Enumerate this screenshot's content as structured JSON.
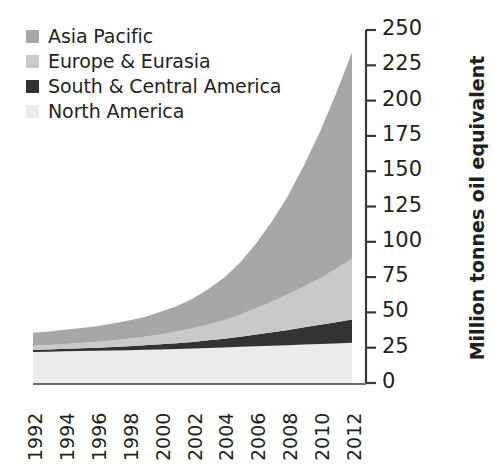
{
  "chart_data": {
    "type": "area",
    "stacked": true,
    "title": "",
    "subtitle": "",
    "xlabel": "",
    "ylabel": "Million tonnes oil equivalent",
    "x": [
      1992,
      1993,
      1994,
      1995,
      1996,
      1997,
      1998,
      1999,
      2000,
      2001,
      2002,
      2003,
      2004,
      2005,
      2006,
      2007,
      2008,
      2009,
      2010,
      2011,
      2012
    ],
    "xlim": [
      1992,
      2012
    ],
    "xticks": [
      1992,
      1994,
      1996,
      1998,
      2000,
      2002,
      2004,
      2006,
      2008,
      2010,
      2012
    ],
    "xticklabels": [
      "1992",
      "1994",
      "1996",
      "1998",
      "2000",
      "2002",
      "2004",
      "2006",
      "2008",
      "2010",
      "2012"
    ],
    "ylim": [
      0,
      250
    ],
    "yticks": [
      0,
      25,
      50,
      75,
      100,
      125,
      150,
      175,
      200,
      225,
      250
    ],
    "yticklabels": [
      "0",
      "25",
      "50",
      "75",
      "100",
      "125",
      "150",
      "175",
      "200",
      "225",
      "250"
    ],
    "yaxis_position": "right",
    "grid": false,
    "legend_position": "top-left",
    "series": [
      {
        "name": "Asia Pacific",
        "color": "#a7a7a7",
        "stack_order": 4,
        "values": [
          9,
          9.5,
          10,
          10.5,
          11,
          12,
          13,
          14,
          16,
          18,
          21,
          25,
          30,
          37,
          46,
          57,
          70,
          86,
          104,
          124,
          146
        ]
      },
      {
        "name": "Europe & Eurasia",
        "color": "#c9c9c9",
        "stack_order": 3,
        "values": [
          3,
          3.2,
          3.5,
          3.8,
          4.2,
          4.7,
          5.3,
          6,
          7,
          8.2,
          9.6,
          11.3,
          13.3,
          15.8,
          18.6,
          21.8,
          25.2,
          29,
          33,
          38,
          43
        ]
      },
      {
        "name": "South & Central America",
        "color": "#333333",
        "stack_order": 2,
        "values": [
          1.5,
          1.6,
          1.8,
          2,
          2.2,
          2.5,
          2.8,
          3.2,
          3.6,
          4.1,
          4.7,
          5.4,
          6.2,
          7.2,
          8.3,
          9.5,
          10.8,
          12.2,
          13.6,
          15,
          16.5
        ]
      },
      {
        "name": "North America",
        "color": "#ebebeb",
        "stack_order": 1,
        "values": [
          22,
          22.2,
          22.4,
          22.6,
          22.8,
          23,
          23.2,
          23.5,
          23.8,
          24.1,
          24.4,
          24.8,
          25.2,
          25.6,
          26,
          26.4,
          26.8,
          27.2,
          27.6,
          28,
          28.5
        ]
      }
    ],
    "totals": [
      35.5,
      36.5,
      37.7,
      38.9,
      40.2,
      42.2,
      44.3,
      46.7,
      50.4,
      54.4,
      59.7,
      66.5,
      74.7,
      85.6,
      98.9,
      114.7,
      132.8,
      154.4,
      178.2,
      205,
      234
    ]
  },
  "legend": {
    "items": [
      {
        "label": "Asia Pacific",
        "color": "#a7a7a7"
      },
      {
        "label": "Europe & Eurasia",
        "color": "#c9c9c9"
      },
      {
        "label": "South & Central America",
        "color": "#333333"
      },
      {
        "label": "North America",
        "color": "#ebebeb"
      }
    ]
  },
  "axis": {
    "y_title": "Million tonnes oil equivalent",
    "axis_color": "#3a3a3a"
  }
}
